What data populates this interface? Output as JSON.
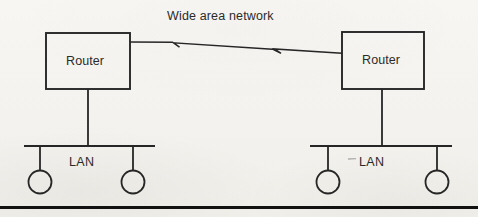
{
  "diagram": {
    "kind": "network-topology-diagram",
    "title": "Wide area network",
    "background_color": "#f6f4f0",
    "ink_color": "#222222",
    "nodes": {
      "router_left_label": "Router",
      "router_right_label": "Router",
      "lan_left_label": "LAN",
      "lan_right_label": "LAN"
    },
    "links": {
      "wan_link_name": "wide-area-network-link",
      "wan_link_style": "lightning-break-line"
    },
    "hosts": {
      "lan_left_count": 2,
      "lan_right_count": 2,
      "host_glyph": "circle"
    },
    "footer": {
      "rule_name": "page-bottom-rule"
    }
  },
  "geometry": {
    "canvas_width": 478,
    "canvas_height": 217,
    "router_left_box": {
      "x": 46,
      "y": 33,
      "w": 84,
      "h": 56
    },
    "router_right_box": {
      "x": 342,
      "y": 32,
      "w": 82,
      "h": 57
    },
    "wan_path": "M130,42 L172,42 L180,47 L173,42.6 L273,49 L281,53 L274,48.6 L342,53",
    "drop_left": {
      "x": 88,
      "y1": 89,
      "y2": 146
    },
    "drop_right": {
      "x": 382,
      "y1": 89,
      "y2": 146
    },
    "bus_left": {
      "x1": 24,
      "x2": 155,
      "y": 146
    },
    "bus_right": {
      "x1": 310,
      "x2": 452,
      "y": 146
    },
    "hosts_left": [
      {
        "cx": 40,
        "cy": 182,
        "r": 11.5,
        "stem_y": 146
      },
      {
        "cx": 133,
        "cy": 182,
        "r": 11.5,
        "stem_y": 146
      }
    ],
    "hosts_right": [
      {
        "cx": 328,
        "cy": 182,
        "r": 11.5,
        "stem_y": 146
      },
      {
        "cx": 437,
        "cy": 182,
        "r": 11.5,
        "stem_y": 146
      }
    ],
    "bottom_rule": {
      "x1": 0,
      "x2": 478,
      "y": 207.5,
      "thickness": 3
    },
    "speck_dash": {
      "x1": 348,
      "x2": 356,
      "y": 159
    }
  }
}
